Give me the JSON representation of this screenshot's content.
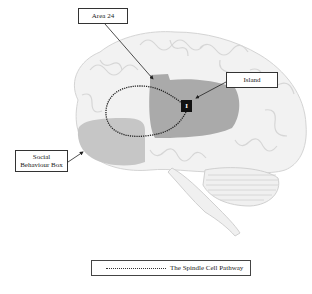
{
  "diagram": {
    "type": "labeled-brain-diagram",
    "labels": {
      "area24": "Area 24",
      "island": "Island",
      "social_behaviour_box": "Social\nBehaviour Box",
      "island_marker": "I"
    },
    "legend": {
      "line_style": "dotted",
      "text": "The Spindle Cell Pathway"
    },
    "colors": {
      "brain_fill": "#f2f2f2",
      "brain_outline": "#d0d0d0",
      "frontal_region": "#c4c4c4",
      "insula_region": "#a8a8a8",
      "pathway": "#222222",
      "marker": "#111111"
    }
  }
}
